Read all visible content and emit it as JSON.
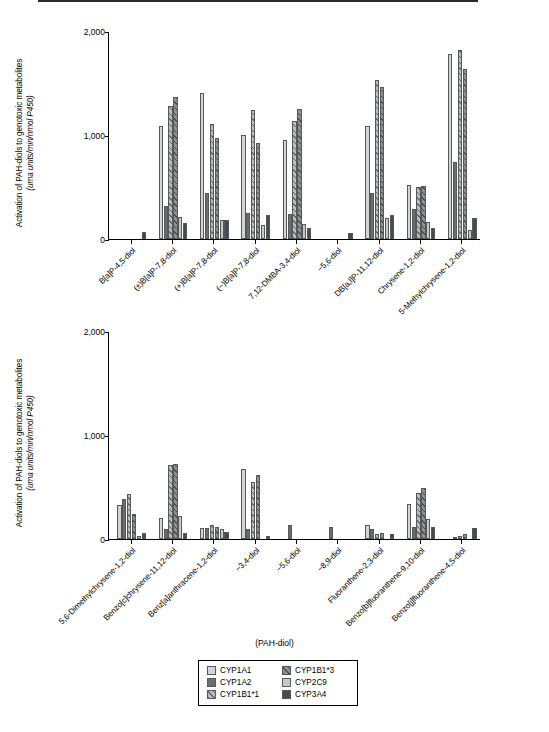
{
  "chart_data": {
    "type": "bar",
    "title": "",
    "xlabel": "(PAH-diol)",
    "ylabel_line1": "Activation of PAH-diols to genotoxic metabolites",
    "ylabel_line2": "(uma units/min/nmol P450)",
    "ylim": [
      0,
      2000
    ],
    "yticks": [
      0,
      1000,
      2000
    ],
    "ytick_labels": [
      "0",
      "1,000",
      "2,000"
    ],
    "grid": false,
    "legend_position": "bottom-center",
    "series_names": [
      "CYP1A1",
      "CYP1A2",
      "CYP1B1*1",
      "CYP1B1*3",
      "CYP2C9",
      "CYP3A4"
    ],
    "panels": [
      {
        "id": "panel-top",
        "categories": [
          "B[a]P-4,5-diol",
          "(±)B[a]P-7,8-diol",
          "(+)B[a]P-7,8-diol",
          "(−)B[a]P-7,8-diol",
          "7,12-DMBA-3,4-diol",
          "−5,6-diol",
          "DB[a,l]P-11,12-diol",
          "Chrysene-1,2-diol",
          "5-Methylchrysene-1,2-diol"
        ],
        "series": [
          {
            "name": "CYP1A1",
            "values": [
              0,
              1090,
              1400,
              1000,
              950,
              0,
              1090,
              520,
              1780
            ]
          },
          {
            "name": "CYP1A2",
            "values": [
              0,
              320,
              440,
              250,
              240,
              0,
              440,
              290,
              740
            ]
          },
          {
            "name": "CYP1B1*1",
            "values": [
              0,
              1280,
              1110,
              1240,
              1130,
              0,
              1530,
              500,
              1820
            ]
          },
          {
            "name": "CYP1B1*3",
            "values": [
              0,
              1370,
              970,
              920,
              1250,
              0,
              1460,
              510,
              1630
            ]
          },
          {
            "name": "CYP2C9",
            "values": [
              0,
              210,
              180,
              130,
              140,
              0,
              200,
              160,
              90
            ]
          },
          {
            "name": "CYP3A4",
            "values": [
              70,
              150,
              180,
              230,
              110,
              60,
              230,
              110,
              200
            ]
          }
        ]
      },
      {
        "id": "panel-bottom",
        "categories": [
          "5,6-Dimethylchrysene-1,2-diol",
          "Benzo[c]chrysene-11,12-diol",
          "Benz[a]anthracene-1,2-diol",
          "−3,4-diol",
          "−5,6-diol",
          "−8,9-diol",
          "Fluoranthene-2,3-diol",
          "Benzo[b]fluoranthene-9,10-diol",
          "Benzo[j]fluoranthene-4,5-diol"
        ],
        "series": [
          {
            "name": "CYP1A1",
            "values": [
              330,
              200,
              110,
              670,
              0,
              0,
              130,
              340,
              0
            ]
          },
          {
            "name": "CYP1A2",
            "values": [
              380,
              100,
              110,
              100,
              130,
              120,
              100,
              120,
              20
            ]
          },
          {
            "name": "CYP1B1*1",
            "values": [
              430,
              710,
              130,
              550,
              0,
              0,
              50,
              440,
              30
            ]
          },
          {
            "name": "CYP1B1*3",
            "values": [
              240,
              720,
              120,
              620,
              0,
              0,
              60,
              490,
              50
            ]
          },
          {
            "name": "CYP2C9",
            "values": [
              30,
              220,
              100,
              0,
              0,
              0,
              0,
              190,
              0
            ]
          },
          {
            "name": "CYP3A4",
            "values": [
              60,
              60,
              70,
              30,
              0,
              0,
              50,
              120,
              110
            ]
          }
        ]
      }
    ]
  },
  "legend": {
    "items": [
      {
        "label": "CYP1A1",
        "swatch": "s0"
      },
      {
        "label": "CYP1B1*3",
        "swatch": "s3"
      },
      {
        "label": "CYP1A2",
        "swatch": "s1"
      },
      {
        "label": "CYP2C9",
        "swatch": "s4"
      },
      {
        "label": "CYP1B1*1",
        "swatch": "s2"
      },
      {
        "label": "CYP3A4",
        "swatch": "s5"
      }
    ]
  }
}
